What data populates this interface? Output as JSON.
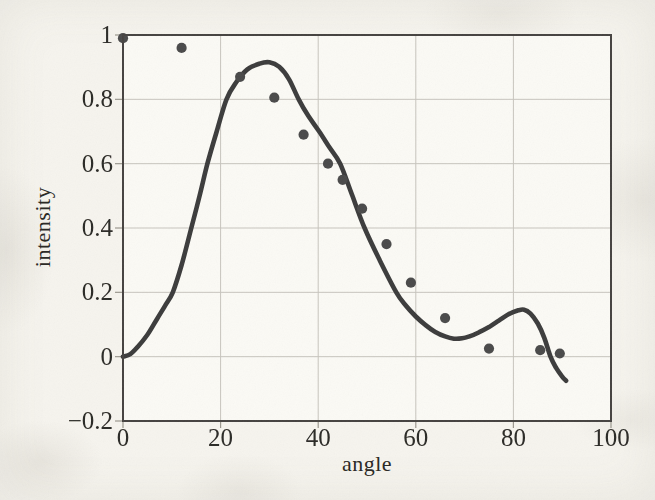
{
  "figure": {
    "kind": "scanned textbook plot",
    "xlabel": "angle",
    "ylabel": "intensity"
  },
  "chart_data": {
    "type": "scatter",
    "title": "",
    "xlabel": "angle",
    "ylabel": "intensity",
    "xlim": [
      0,
      100
    ],
    "ylim": [
      -0.2,
      1.0
    ],
    "grid": true,
    "legend": false,
    "x_ticks": [
      0,
      20,
      40,
      60,
      80,
      100
    ],
    "y_ticks": [
      -0.2,
      0,
      0.2,
      0.4,
      0.6,
      0.8,
      1
    ],
    "x_tick_labels": [
      "0",
      "20",
      "40",
      "60",
      "80",
      "100"
    ],
    "y_tick_labels": [
      "−0.2",
      "0",
      "0.2",
      "0.4",
      "0.6",
      "0.8",
      "1"
    ],
    "colors": {
      "paper": "#f6f4ee",
      "plot_background": "#fbfaf5",
      "grid": "#c7c4bd",
      "frame": "#45433f",
      "tick": "#9b978e",
      "text": "#2c2a26",
      "curve": "#3b3b3b",
      "points": "#4a4a4a"
    },
    "series": [
      {
        "name": "measured-points",
        "type": "scatter",
        "marker": "circle",
        "color": "#4a4a4a",
        "points": [
          [
            0,
            0.99
          ],
          [
            12,
            0.96
          ],
          [
            24,
            0.87
          ],
          [
            31,
            0.805
          ],
          [
            37,
            0.69
          ],
          [
            42,
            0.6
          ],
          [
            45,
            0.55
          ],
          [
            49,
            0.46
          ],
          [
            54,
            0.35
          ],
          [
            59,
            0.23
          ],
          [
            66,
            0.12
          ],
          [
            75,
            0.025
          ],
          [
            85.5,
            0.02
          ],
          [
            89.5,
            0.01
          ]
        ]
      },
      {
        "name": "fit-curve",
        "type": "line",
        "color": "#3b3b3b",
        "width": 4.6,
        "points": [
          [
            0,
            0.0
          ],
          [
            1.5,
            0.008
          ],
          [
            3,
            0.03
          ],
          [
            5,
            0.068
          ],
          [
            7,
            0.118
          ],
          [
            8.6,
            0.158
          ],
          [
            10.2,
            0.2
          ],
          [
            12,
            0.285
          ],
          [
            14,
            0.4
          ],
          [
            15.7,
            0.5
          ],
          [
            17.3,
            0.6
          ],
          [
            19.2,
            0.7
          ],
          [
            21.2,
            0.8
          ],
          [
            23.2,
            0.853
          ],
          [
            25.5,
            0.893
          ],
          [
            28,
            0.911
          ],
          [
            30,
            0.915
          ],
          [
            32,
            0.901
          ],
          [
            34,
            0.863
          ],
          [
            36,
            0.8
          ],
          [
            38,
            0.748
          ],
          [
            40.2,
            0.7
          ],
          [
            42.3,
            0.651
          ],
          [
            44.5,
            0.6
          ],
          [
            47,
            0.5
          ],
          [
            49.5,
            0.4
          ],
          [
            52.6,
            0.3
          ],
          [
            56,
            0.2
          ],
          [
            58,
            0.158
          ],
          [
            60,
            0.125
          ],
          [
            62,
            0.098
          ],
          [
            64,
            0.077
          ],
          [
            66,
            0.063
          ],
          [
            67.8,
            0.056
          ],
          [
            69.5,
            0.057
          ],
          [
            71,
            0.063
          ],
          [
            73,
            0.076
          ],
          [
            75,
            0.092
          ],
          [
            77,
            0.112
          ],
          [
            79,
            0.132
          ],
          [
            81,
            0.144
          ],
          [
            82.2,
            0.146
          ],
          [
            83.5,
            0.134
          ],
          [
            85,
            0.103
          ],
          [
            86.3,
            0.06
          ],
          [
            87.6,
            0.0
          ],
          [
            88.8,
            -0.036
          ],
          [
            90,
            -0.062
          ],
          [
            90.8,
            -0.075
          ]
        ]
      }
    ]
  }
}
